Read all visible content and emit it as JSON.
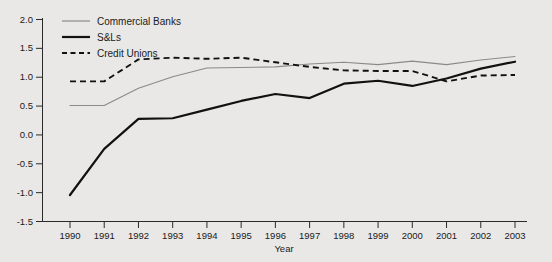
{
  "chart_data": {
    "type": "line",
    "title": "",
    "subtitle": "",
    "xlabel": "Year",
    "ylabel": "",
    "categories": [
      "1990",
      "1991",
      "1992",
      "1993",
      "1994",
      "1995",
      "1996",
      "1997",
      "1998",
      "1999",
      "2000",
      "2001",
      "2002",
      "2003"
    ],
    "x": [
      1990,
      1991,
      1992,
      1993,
      1994,
      1995,
      1996,
      1997,
      1998,
      1999,
      2000,
      2001,
      2002,
      2003
    ],
    "xlim": [
      1990,
      2003
    ],
    "ylim": [
      -1.5,
      2.0
    ],
    "ytick_labels": [
      "2.0",
      "1.5",
      "1.0",
      "0.5",
      "0.0",
      "-0.5",
      "-1.0",
      "-1.5"
    ],
    "ytick_values": [
      2.0,
      1.5,
      1.0,
      0.5,
      0.0,
      -0.5,
      -1.0,
      -1.5
    ],
    "grid": false,
    "legend_position": "top-left",
    "series": [
      {
        "name": "Commercial Banks",
        "style": "solid-thin",
        "color": "#8a8a8a",
        "values": [
          0.5,
          0.5,
          0.8,
          1.0,
          1.15,
          1.16,
          1.17,
          1.22,
          1.25,
          1.21,
          1.27,
          1.21,
          1.29,
          1.35
        ]
      },
      {
        "name": "S&Ls",
        "style": "solid-thick",
        "color": "#111111",
        "values": [
          -1.05,
          -0.25,
          0.27,
          0.28,
          0.43,
          0.58,
          0.7,
          0.63,
          0.88,
          0.93,
          0.84,
          0.97,
          1.14,
          1.26
        ]
      },
      {
        "name": "Credit Unions",
        "style": "dashed",
        "color": "#111111",
        "values": [
          0.92,
          0.92,
          1.3,
          1.33,
          1.31,
          1.33,
          1.25,
          1.17,
          1.11,
          1.1,
          1.1,
          0.92,
          1.02,
          1.03
        ]
      }
    ]
  },
  "legend": {
    "items": [
      {
        "label": "Commercial Banks"
      },
      {
        "label": "S&Ls"
      },
      {
        "label": "Credit Unions"
      }
    ]
  },
  "axes": {
    "x_axis_title": "Year"
  }
}
